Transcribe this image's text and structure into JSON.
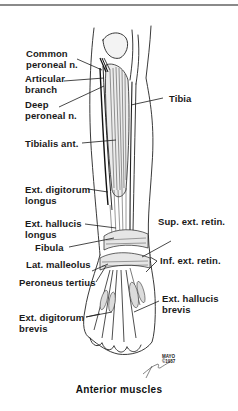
{
  "figure": {
    "caption": "Anterior muscles",
    "copyright_mark": {
      "line1": "MAYO",
      "line2": "©1987"
    },
    "colors": {
      "ink": "#1a1a1a",
      "rule": "#8a8a8a",
      "background": "#ffffff"
    }
  },
  "labels": {
    "common_peroneal": {
      "line1": "Common",
      "line2": "peroneal n."
    },
    "articular_branch": {
      "line1": "Articular",
      "line2": "branch"
    },
    "deep_peroneal": {
      "line1": "Deep",
      "line2": "peroneal n."
    },
    "tibia": "Tibia",
    "tibialis_ant": "Tibialis ant.",
    "ext_digitorum_longus": {
      "line1": "Ext. digitorum",
      "line2": "longus"
    },
    "ext_hallucis_longus": {
      "line1": "Ext. hallucis",
      "line2": "longus"
    },
    "fibula": "Fibula",
    "lat_malleolus": "Lat. malleolus",
    "peroneus_tertius": "Peroneus tertius",
    "ext_digitorum_brevis": {
      "line1": "Ext. digitorum",
      "line2": "brevis"
    },
    "sup_ext_retin": "Sup. ext. retin.",
    "inf_ext_retin": "Inf. ext. retin.",
    "ext_hallucis_brevis": {
      "line1": "Ext. hallucis",
      "line2": "brevis"
    }
  }
}
